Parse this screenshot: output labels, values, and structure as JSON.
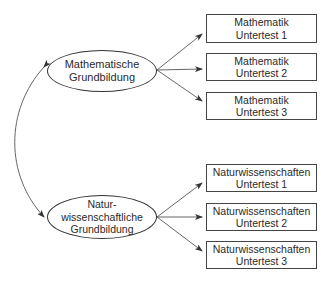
{
  "diagram": {
    "latent_factors": [
      {
        "id": "math",
        "lines": [
          "Mathematische",
          "Grundbildung"
        ]
      },
      {
        "id": "science",
        "lines": [
          "Natur-",
          "wissenschaftliche",
          "Grundbildung"
        ]
      }
    ],
    "indicators": {
      "math": [
        {
          "line1": "Mathematik",
          "line2": "Untertest 1"
        },
        {
          "line1": "Mathematik",
          "line2": "Untertest 2"
        },
        {
          "line1": "Mathematik",
          "line2": "Untertest 3"
        }
      ],
      "science": [
        {
          "line1": "Naturwissenschaften",
          "line2": "Untertest 1"
        },
        {
          "line1": "Naturwissenschaften",
          "line2": "Untertest 2"
        },
        {
          "line1": "Naturwissenschaften",
          "line2": "Untertest 3"
        }
      ]
    },
    "correlation": {
      "from": "math",
      "to": "science",
      "type": "double-headed-curved-arrow"
    },
    "colors": {
      "stroke": "#333333",
      "text": "#2a2a2a",
      "background": "#ffffff"
    }
  }
}
